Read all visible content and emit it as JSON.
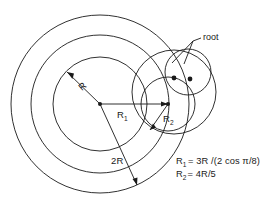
{
  "figure": {
    "background_color": "#ffffff",
    "stroke_color": "#1a1a1a",
    "width": 275,
    "height": 203
  },
  "labels": {
    "radius_R": "R",
    "radius_R1_main": "R",
    "radius_R1_sub": "1",
    "radius_R2_main": "R",
    "radius_R2_sub": "2",
    "diameter_2R": "2R",
    "root": "root"
  },
  "formulas": {
    "line1_main": "R",
    "line1_sub": "1",
    "line1_rest": "= 3R /(2 cos π/8)",
    "line2_main": "R",
    "line2_sub": "2",
    "line2_rest": "= 4R/5"
  },
  "geometry": {
    "center_main": {
      "x": 100,
      "y": 104
    },
    "circles": [
      {
        "name": "outer-2R-circle",
        "cx": 100,
        "cy": 104,
        "r": 89
      },
      {
        "name": "R-circle",
        "cx": 100,
        "cy": 104,
        "r": 47
      },
      {
        "name": "R1-circle",
        "cx": 100,
        "cy": 104,
        "r": 69
      },
      {
        "name": "R2-circle",
        "cx": 168,
        "cy": 104,
        "r": 27
      },
      {
        "name": "root-circle-large",
        "cx": 174,
        "cy": 92,
        "r": 42
      },
      {
        "name": "root-circle-small",
        "cx": 188,
        "cy": 72,
        "r": 23
      }
    ],
    "dots": [
      {
        "name": "root-dot-left",
        "x": 174,
        "y": 78,
        "r": 2.4
      },
      {
        "name": "root-dot-right",
        "x": 190,
        "y": 79,
        "r": 2.4
      },
      {
        "name": "center-dot-main",
        "x": 100,
        "y": 104,
        "r": 2.0
      },
      {
        "name": "center-dot-r2",
        "x": 168,
        "y": 104,
        "r": 2.0
      }
    ]
  }
}
